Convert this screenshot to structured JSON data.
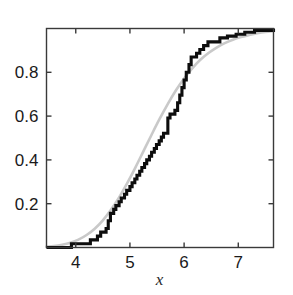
{
  "chart_data": {
    "type": "line",
    "title": "",
    "subtitle": "",
    "xlabel": "x",
    "ylabel": "",
    "xlim": [
      3.46,
      7.65
    ],
    "ylim": [
      0.0,
      1.0
    ],
    "grid": false,
    "legend": null,
    "xticks": [
      4,
      5,
      6,
      7
    ],
    "xtick_labels": [
      "4",
      "5",
      "6",
      "7"
    ],
    "yticks": [
      0.2,
      0.4,
      0.6,
      0.8
    ],
    "ytick_labels": [
      "0.2",
      "0.4",
      "0.6",
      "0.8"
    ],
    "colors": {
      "empirical": "#0d0d0d",
      "theoretical": "#c9c9c9",
      "axis": "#3a3a3a",
      "background": "#ffffff"
    },
    "series": [
      {
        "name": "empirical-cdf",
        "type": "step",
        "color": "#0d0d0d",
        "linewidth": 3.1,
        "x": [
          3.46,
          3.9,
          3.92,
          4.23,
          4.27,
          4.4,
          4.46,
          4.52,
          4.56,
          4.6,
          4.64,
          4.7,
          4.74,
          4.8,
          4.84,
          4.9,
          4.94,
          5.0,
          5.04,
          5.09,
          5.13,
          5.18,
          5.22,
          5.27,
          5.31,
          5.36,
          5.4,
          5.45,
          5.49,
          5.54,
          5.58,
          5.62,
          5.66,
          5.7,
          5.74,
          5.79,
          5.83,
          5.88,
          5.92,
          5.96,
          6.0,
          6.04,
          6.09,
          6.13,
          6.18,
          6.23,
          6.29,
          6.36,
          6.44,
          6.54,
          6.66,
          6.8,
          6.96,
          7.12,
          7.3,
          7.65
        ],
        "y": [
          0.0,
          0.0,
          0.017,
          0.017,
          0.035,
          0.052,
          0.07,
          0.07,
          0.087,
          0.122,
          0.156,
          0.174,
          0.191,
          0.209,
          0.226,
          0.243,
          0.261,
          0.278,
          0.296,
          0.313,
          0.33,
          0.348,
          0.365,
          0.383,
          0.4,
          0.417,
          0.435,
          0.452,
          0.47,
          0.487,
          0.504,
          0.522,
          0.522,
          0.591,
          0.609,
          0.609,
          0.626,
          0.661,
          0.696,
          0.73,
          0.765,
          0.8,
          0.835,
          0.87,
          0.87,
          0.887,
          0.904,
          0.922,
          0.939,
          0.939,
          0.957,
          0.965,
          0.974,
          0.983,
          0.991,
          1.0
        ]
      },
      {
        "name": "theoretical-cdf",
        "type": "smooth",
        "color": "#c9c9c9",
        "linewidth": 2.6,
        "x": [
          3.46,
          3.6,
          3.75,
          3.9,
          4.05,
          4.2,
          4.35,
          4.5,
          4.65,
          4.8,
          4.95,
          5.1,
          5.25,
          5.4,
          5.55,
          5.7,
          5.85,
          6.0,
          6.15,
          6.3,
          6.45,
          6.6,
          6.75,
          6.9,
          7.05,
          7.2,
          7.35,
          7.5,
          7.65
        ],
        "y": [
          0.004,
          0.007,
          0.013,
          0.022,
          0.036,
          0.057,
          0.086,
          0.124,
          0.172,
          0.229,
          0.294,
          0.365,
          0.44,
          0.515,
          0.588,
          0.656,
          0.718,
          0.772,
          0.818,
          0.857,
          0.888,
          0.913,
          0.933,
          0.949,
          0.961,
          0.97,
          0.978,
          0.984,
          0.988
        ]
      }
    ]
  },
  "axes": {
    "x_axis_title": "x"
  }
}
